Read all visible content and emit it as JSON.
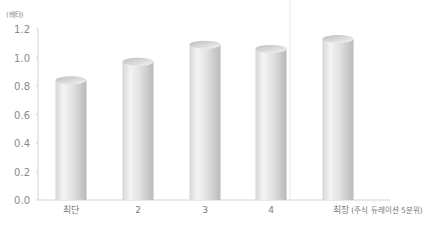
{
  "chart_data": {
    "type": "bar",
    "style": "3d-cylinder",
    "title": "",
    "unit_label": "(베타)",
    "xlabel": "",
    "ylabel": "베타",
    "ylim": [
      0,
      1.2
    ],
    "yticks": [
      "0.0",
      "0.2",
      "0.4",
      "0.6",
      "0.8",
      "1.0",
      "1.2"
    ],
    "categories": [
      "최단",
      "2",
      "3",
      "4",
      "최장"
    ],
    "category_annotation": "(주식 듀레이션 5분위)",
    "values": [
      0.84,
      0.97,
      1.09,
      1.06,
      1.13
    ],
    "grid": false,
    "legend": null,
    "colors": {
      "bar_light": "#f2f2f2",
      "bar_mid": "#d9d9d9",
      "bar_dark": "#b8b8b8",
      "axis": "#cfcfcf",
      "text": "#8a8a8a"
    }
  }
}
